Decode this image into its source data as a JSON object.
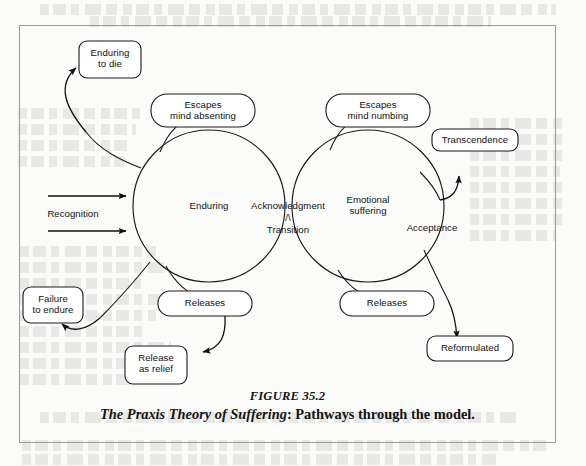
{
  "figure": {
    "number": "FIGURE 35.2",
    "title": "The Praxis Theory of Suffering",
    "subtitle": ": Pathways through the model."
  },
  "diagram": {
    "circles": [
      {
        "id": "enduring",
        "label": "Enduring"
      },
      {
        "id": "emotional-suffering",
        "label": "Emotional\nsuffering"
      }
    ],
    "boxes": [
      {
        "id": "enduring-to-die",
        "label": "Enduring\nto die"
      },
      {
        "id": "escapes-mind-absenting",
        "label": "Escapes\nmind absenting"
      },
      {
        "id": "escapes-mind-numbing",
        "label": "Escapes\nmind numbing"
      },
      {
        "id": "transcendence",
        "label": "Transcendence"
      },
      {
        "id": "failure-to-endure",
        "label": "Failure\nto endure"
      },
      {
        "id": "releases-left",
        "label": "Releases"
      },
      {
        "id": "releases-right",
        "label": "Releases"
      },
      {
        "id": "release-as-relief",
        "label": "Release\nas relief"
      },
      {
        "id": "reformulated",
        "label": "Reformulated"
      }
    ],
    "edge_labels": [
      {
        "id": "recognition",
        "label": "Recognition"
      },
      {
        "id": "acknowledgment",
        "label": "Acknowledgment"
      },
      {
        "id": "transition-marker",
        "label": "/\\"
      },
      {
        "id": "transition",
        "label": "Transition"
      },
      {
        "id": "acceptance",
        "label": "Acceptance"
      }
    ]
  },
  "colors": {
    "ink": "#1a1a1a",
    "frame": "#9a9a9a",
    "paper": "#fbfbfa"
  }
}
